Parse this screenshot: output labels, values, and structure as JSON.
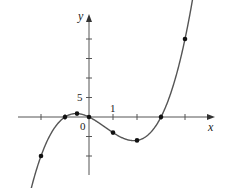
{
  "diagram": {
    "type": "function-graph",
    "function": "y = x^3 - 2x^2 - 3x",
    "axis_labels": {
      "x": "x",
      "y": "y"
    },
    "tick_labels": {
      "origin": "0",
      "x_unit": "1",
      "y_unit": "5"
    },
    "x_ticks": [
      -2,
      -1,
      0,
      1,
      2,
      3,
      4
    ],
    "y_ticks": [
      -10,
      -5,
      5,
      10,
      15,
      20
    ],
    "points": [
      {
        "x": -2,
        "y": -10
      },
      {
        "x": -1,
        "y": 0
      },
      {
        "x": -0.5,
        "y": 0.875
      },
      {
        "x": 0,
        "y": 0
      },
      {
        "x": 1,
        "y": -4
      },
      {
        "x": 2,
        "y": -6
      },
      {
        "x": 3,
        "y": 0
      },
      {
        "x": 4,
        "y": 20
      }
    ],
    "colors": {
      "curve": "#555555",
      "axis": "#555555",
      "point": "#111111"
    }
  }
}
